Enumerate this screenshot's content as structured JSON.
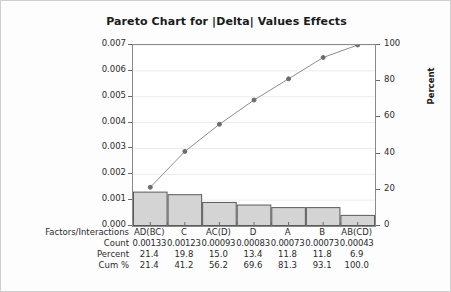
{
  "chart_data": {
    "type": "bar",
    "title": "Pareto Chart for  |Delta|  Values Effects",
    "categories": [
      "AD(BC)",
      "C",
      "AC(D)",
      "D",
      "A",
      "B",
      "AB(CD)"
    ],
    "values": [
      0.00133,
      0.00123,
      0.00093,
      0.00083,
      0.00073,
      0.00073,
      0.00043
    ],
    "series": [
      {
        "name": "Count",
        "values": [
          0.00133,
          0.00123,
          0.00093,
          0.00083,
          0.00073,
          0.00073,
          0.00043
        ]
      },
      {
        "name": "Percent",
        "values": [
          21.4,
          19.8,
          15.0,
          13.4,
          11.8,
          11.8,
          6.9
        ]
      },
      {
        "name": "Cum %",
        "values": [
          21.4,
          41.2,
          56.2,
          69.6,
          81.3,
          93.1,
          100.0
        ]
      }
    ],
    "xlabel": "Factors/Interactions",
    "ylabel": "|Delta Std. Dev.|",
    "ylabel_right": "Percent",
    "ylim": [
      0.0,
      0.007
    ],
    "ylim_right": [
      0,
      100
    ],
    "yticks": [
      "0.000",
      "0.001",
      "0.002",
      "0.003",
      "0.004",
      "0.005",
      "0.006",
      "0.007"
    ],
    "ytick_values": [
      0.0,
      0.001,
      0.002,
      0.003,
      0.004,
      0.005,
      0.006,
      0.007
    ],
    "yticks_right": [
      "0",
      "20",
      "40",
      "60",
      "80",
      "100"
    ],
    "ytick_values_right": [
      0,
      20,
      40,
      60,
      80,
      100
    ],
    "grid": true,
    "legend": "none",
    "bar_fill": "#d4d4d4",
    "bar_stroke": "#5a5a5a",
    "line_color": "#8e8e8e",
    "marker_color": "#6d6d6d"
  },
  "table": {
    "row_labels": [
      "Factors/Interactions",
      "Count",
      "Percent",
      "Cum %"
    ],
    "rows": [
      [
        "AD(BC)",
        "C",
        "AC(D)",
        "D",
        "A",
        "B",
        "AB(CD)"
      ],
      [
        "0.00133",
        "0.00123",
        "0.00093",
        "0.00083",
        "0.00073",
        "0.00073",
        "0.00043"
      ],
      [
        "21.4",
        "19.8",
        "15.0",
        "13.4",
        "11.8",
        "11.8",
        "6.9"
      ],
      [
        "21.4",
        "41.2",
        "56.2",
        "69.6",
        "81.3",
        "93.1",
        "100.0"
      ]
    ]
  }
}
